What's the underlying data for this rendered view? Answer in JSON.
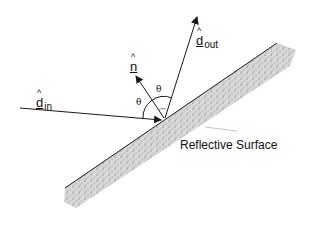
{
  "diagram": {
    "labels": {
      "incident": {
        "symbol": "d",
        "hat": "^",
        "subscript": "in"
      },
      "normal": {
        "symbol": "n",
        "hat": "^"
      },
      "outgoing": {
        "symbol": "d",
        "hat": "^",
        "subscript": "out"
      },
      "angle_incident": "θ",
      "angle_reflected": "θ",
      "surface": "Reflective Surface"
    },
    "colors": {
      "line": "#1a1a1a",
      "surface_fill": "#cfcfcf",
      "leader": "#b5b5b5",
      "background": "#ffffff"
    }
  }
}
